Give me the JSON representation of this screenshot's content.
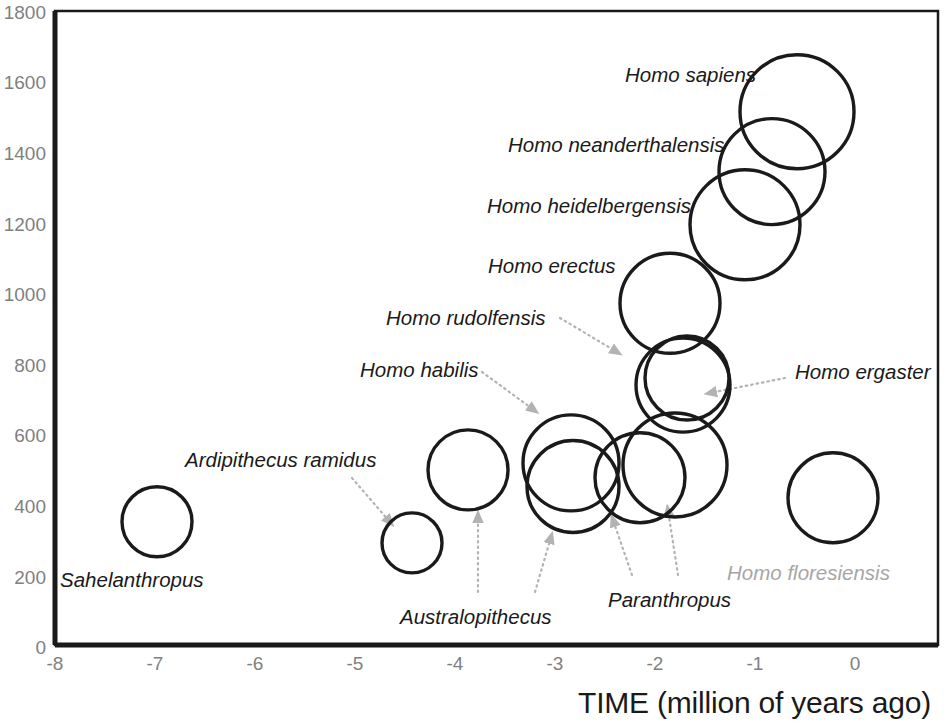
{
  "chart_data": {
    "type": "scatter",
    "title": "",
    "subtitle": "",
    "xlabel": "TIME (million of years ago)",
    "ylabel": "",
    "xlim": [
      -8,
      0.83
    ],
    "ylim": [
      0,
      1800
    ],
    "grid": false,
    "legend": "none",
    "xticks": [
      "-8",
      "-7",
      "-6",
      "-5",
      "-4",
      "-3",
      "-2",
      "-1",
      "0"
    ],
    "xtick_values": [
      -8,
      -7,
      -6,
      -5,
      -4,
      -3,
      -2,
      -1,
      0
    ],
    "yticks": [
      "0",
      "200",
      "400",
      "600",
      "800",
      "1000",
      "1200",
      "1400",
      "1600",
      "1800"
    ],
    "ytick_values": [
      0,
      200,
      400,
      600,
      800,
      1000,
      1200,
      1400,
      1600,
      1800
    ],
    "marker": "open-circle",
    "marker_color": "#1a1a1a",
    "note": "Circle radius is proportional to cranial capacity spread; y is brain volume in cm3, x is time in millions of years ago.",
    "points": [
      {
        "name": "Sahelanthropus",
        "x": -6.98,
        "y": 350,
        "r_px": 35,
        "label_x": 60,
        "label_y": 570,
        "label_color": "#1a1a1a",
        "leader": null
      },
      {
        "name": "Ardipithecus ramidus",
        "x": -4.43,
        "y": 290,
        "r_px": 30,
        "label_x": 185,
        "label_y": 450,
        "label_color": "#1a1a1a",
        "leader": {
          "x1": 352,
          "y1": 478,
          "x2": 390,
          "y2": 522
        }
      },
      {
        "name": "Australopithecus",
        "x": -3.87,
        "y": 497,
        "r_px": 40,
        "label_x": 400,
        "label_y": 607,
        "label_color": "#1a1a1a",
        "leader": {
          "x1": 478,
          "y1": 592,
          "x2": 478,
          "y2": 516
        }
      },
      {
        "name": "Australopithecus",
        "x": -2.82,
        "y": 450,
        "r_px": 46,
        "label_x": null,
        "label_y": null,
        "label_color": "#1a1a1a",
        "leader": {
          "x1": 535,
          "y1": 592,
          "x2": 551,
          "y2": 537
        }
      },
      {
        "name": "Homo habilis",
        "x": -2.84,
        "y": 517,
        "r_px": 48,
        "label_x": 360,
        "label_y": 360,
        "label_color": "#1a1a1a",
        "leader": {
          "x1": 482,
          "y1": 372,
          "x2": 534,
          "y2": 410
        }
      },
      {
        "name": "Paranthropus",
        "x": -2.15,
        "y": 475,
        "r_px": 45,
        "label_x": 608,
        "label_y": 590,
        "label_color": "#1a1a1a",
        "leader": {
          "x1": 632,
          "y1": 575,
          "x2": 613,
          "y2": 520
        }
      },
      {
        "name": "Paranthropus",
        "x": -1.8,
        "y": 511,
        "r_px": 52,
        "label_x": null,
        "label_y": null,
        "label_color": "#1a1a1a",
        "leader": {
          "x1": 678,
          "y1": 575,
          "x2": 668,
          "y2": 510
        }
      },
      {
        "name": "Homo rudolfensis",
        "x": -1.68,
        "y": 758,
        "r_px": 42,
        "label_x": 386,
        "label_y": 308,
        "label_color": "#1a1a1a",
        "leader": {
          "x1": 560,
          "y1": 318,
          "x2": 617,
          "y2": 352
        }
      },
      {
        "name": "Homo erectus",
        "x": -1.85,
        "y": 970,
        "r_px": 50,
        "label_x": 488,
        "label_y": 256,
        "label_color": "#1a1a1a",
        "leader": null
      },
      {
        "name": "Homo ergaster",
        "x": -1.72,
        "y": 738,
        "r_px": 47,
        "label_x": 795,
        "label_y": 362,
        "label_color": "#1a1a1a",
        "leader": {
          "x1": 785,
          "y1": 378,
          "x2": 710,
          "y2": 393
        }
      },
      {
        "name": "Homo heidelbergensis",
        "x": -1.1,
        "y": 1193,
        "r_px": 55,
        "label_x": 487,
        "label_y": 196,
        "label_color": "#1a1a1a",
        "leader": null
      },
      {
        "name": "Homo neanderthalensis",
        "x": -0.83,
        "y": 1344,
        "r_px": 53,
        "label_x": 508,
        "label_y": 135,
        "label_color": "#1a1a1a",
        "leader": null
      },
      {
        "name": "Homo sapiens",
        "x": -0.58,
        "y": 1514,
        "r_px": 57,
        "label_x": 625,
        "label_y": 65,
        "label_color": "#1a1a1a",
        "leader": null
      },
      {
        "name": "Homo floresiensis",
        "x": -0.22,
        "y": 418,
        "r_px": 45,
        "label_x": 727,
        "label_y": 563,
        "label_color": "#a6a6a6",
        "leader": null
      }
    ]
  },
  "axes": {
    "x_title": "TIME (million of years ago)",
    "x_tick_0": "-8",
    "x_tick_1": "-7",
    "x_tick_2": "-6",
    "x_tick_3": "-5",
    "x_tick_4": "-4",
    "x_tick_5": "-3",
    "x_tick_6": "-2",
    "x_tick_7": "-1",
    "x_tick_8": "0",
    "y_tick_0": "0",
    "y_tick_1": "200",
    "y_tick_2": "400",
    "y_tick_3": "600",
    "y_tick_4": "800",
    "y_tick_5": "1000",
    "y_tick_6": "1200",
    "y_tick_7": "1400",
    "y_tick_8": "1600",
    "y_tick_9": "1800"
  },
  "labels": {
    "sahelanthropus": "Sahelanthropus",
    "ardipithecus_ramidus": "Ardipithecus ramidus",
    "australopithecus": "Australopithecus",
    "homo_habilis": "Homo habilis",
    "paranthropus": "Paranthropus",
    "homo_rudolfensis": "Homo rudolfensis",
    "homo_erectus": "Homo erectus",
    "homo_ergaster": "Homo ergaster",
    "homo_heidelbergensis": "Homo heidelbergensis",
    "homo_neanderthalensis": "Homo neanderthalensis",
    "homo_sapiens": "Homo sapiens",
    "homo_floresiensis": "Homo floresiensis"
  }
}
